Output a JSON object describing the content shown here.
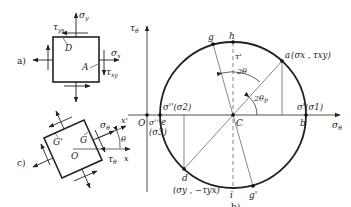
{
  "figure_a": {
    "panel_label": "a)",
    "sigma_y": "σ",
    "sigma_y_sub": "y",
    "tau_yx": "τ",
    "tau_yx_sub": "yx",
    "sigma_x": "σ",
    "sigma_x_sub": "x",
    "tau_xy": "τ",
    "tau_xy_sub": "xy",
    "point_D": "D",
    "point_A": "A"
  },
  "figure_b": {
    "panel_label": "b)",
    "axis_tau": "τ",
    "axis_tau_sub": "θ",
    "axis_sigma": "σ",
    "axis_sigma_sub": "θ",
    "origin": "O",
    "center": "C",
    "point_a": "a",
    "point_a_coords": "(σx , τxy)",
    "point_b": "b",
    "point_b_label": "σ'(σ1)",
    "point_d": "d",
    "point_d_coords": "(σy , −τyx)",
    "point_e": "e",
    "point_e_label_top": "σ''(σ2)",
    "point_e_label_left": "σ'''",
    "point_e_label_below": "(σ3)",
    "point_g": "g",
    "point_g_prime": "g'",
    "point_h": "h",
    "point_i": "i",
    "tau_prime": "τ'",
    "angle_2theta": "2θ",
    "angle_2theta_p": "2θ",
    "angle_2theta_p_sub": "P"
  },
  "figure_c": {
    "panel_label": "c)",
    "point_G_prime": "G'",
    "point_G": "G",
    "point_O": "O",
    "sigma_theta": "σ",
    "sigma_theta_sub": "θ",
    "tau_theta": "τ",
    "tau_theta_sub": "θ",
    "axis_x_prime": "x'",
    "axis_x": "x",
    "angle_theta": "θ"
  }
}
